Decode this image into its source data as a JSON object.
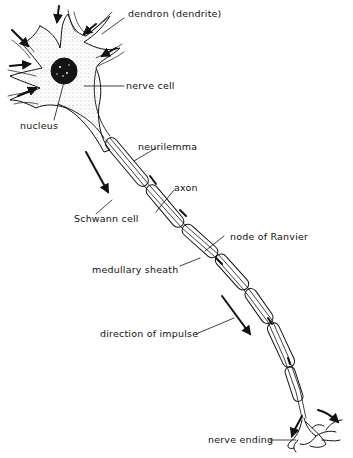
{
  "diagram": {
    "labels": {
      "dendron": "dendron (dendrite)",
      "nerve_cell": "nerve cell",
      "nucleus": "nucleus",
      "neurilemma": "neurilemma",
      "axon": "axon",
      "schwann_cell": "Schwann cell",
      "node_of_ranvier": "node of Ranvier",
      "medullary_sheath": "medullary sheath",
      "direction_of_impulse": "direction of impulse",
      "nerve_ending": "nerve ending"
    },
    "colors": {
      "ink": "#111111",
      "background": "#ffffff",
      "cytoplasm_stipple": "#cfcfcf",
      "nucleus_fill": "#141414"
    }
  }
}
